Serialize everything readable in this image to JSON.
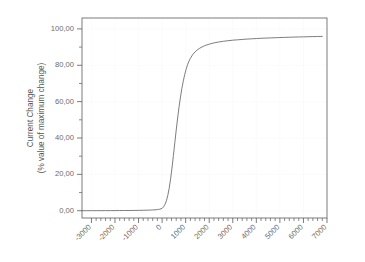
{
  "chart_data": {
    "type": "line",
    "title": "",
    "subtitle": "",
    "xlabel": "",
    "ylabel": "Current Change\n(% value of maximum change)",
    "ylabel_line1": "Current Change",
    "ylabel_line2": "(% value of maximum change)",
    "xlim": [
      -3400,
      7000
    ],
    "ylim": [
      -4.0,
      106.0
    ],
    "grid": true,
    "legend": null,
    "legend_position": "none",
    "x_major_ticks": [
      -3000,
      -2000,
      -1000,
      0,
      1000,
      2000,
      3000,
      4000,
      5000,
      6000,
      7000
    ],
    "x_tick_labels": [
      "-3000",
      "-2000",
      "-1000",
      "0",
      "1000",
      "2000",
      "3000",
      "4000",
      "5000",
      "6000",
      "7000"
    ],
    "x_minor_step": 200,
    "y_major_ticks": [
      0,
      20,
      40,
      60,
      80,
      100
    ],
    "y_tick_labels": [
      "0,00",
      "20,00",
      "40,00",
      "60,00",
      "80,00",
      "100,00"
    ],
    "y_minor_step": 10,
    "series": [
      {
        "name": "Current Change",
        "color": "#6e6e6e",
        "x": [
          -3400,
          -3200,
          -3000,
          -2800,
          -2600,
          -2400,
          -2200,
          -2000,
          -1800,
          -1600,
          -1400,
          -1200,
          -1000,
          -800,
          -600,
          -500,
          -400,
          -300,
          -200,
          -100,
          0,
          60,
          120,
          180,
          240,
          300,
          360,
          420,
          480,
          540,
          600,
          660,
          720,
          780,
          840,
          900,
          960,
          1020,
          1080,
          1140,
          1200,
          1300,
          1400,
          1500,
          1600,
          1700,
          1800,
          1900,
          2000,
          2200,
          2400,
          2600,
          2800,
          3000,
          3200,
          3400,
          3600,
          3800,
          4000,
          4200,
          4400,
          4600,
          4800,
          5000,
          5200,
          5400,
          5600,
          5800,
          6000,
          6200,
          6400,
          6600,
          6800
        ],
        "y": [
          0.02,
          0.02,
          0.03,
          0.03,
          0.04,
          0.05,
          0.06,
          0.07,
          0.09,
          0.11,
          0.13,
          0.16,
          0.2,
          0.25,
          0.32,
          0.36,
          0.42,
          0.5,
          0.62,
          0.85,
          1.3,
          2.1,
          3.4,
          5.4,
          8.3,
          12.3,
          17.4,
          23.5,
          30.3,
          37.4,
          44.4,
          51.0,
          57.1,
          62.5,
          67.3,
          71.4,
          74.9,
          77.8,
          80.3,
          82.2,
          83.8,
          85.9,
          87.4,
          88.5,
          89.4,
          90.1,
          90.7,
          91.2,
          91.6,
          92.3,
          92.8,
          93.2,
          93.5,
          93.8,
          94.0,
          94.2,
          94.4,
          94.55,
          94.7,
          94.85,
          94.95,
          95.05,
          95.15,
          95.25,
          95.35,
          95.42,
          95.5,
          95.57,
          95.63,
          95.7,
          95.76,
          95.82,
          95.88
        ]
      }
    ]
  },
  "figure": {
    "background_color": "#ffffff",
    "axis_color": "#5a5a5a",
    "grid_color": "#fafafa",
    "text_color": "#6a6a6a"
  }
}
